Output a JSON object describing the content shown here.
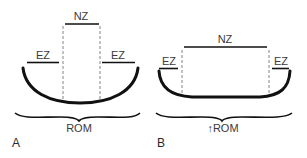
{
  "figure": {
    "panel_a": {
      "panel_label": "A",
      "neutral_zone_label": "NZ",
      "elastic_zone_left_label": "EZ",
      "elastic_zone_right_label": "EZ",
      "range_label": "ROM"
    },
    "panel_b": {
      "panel_label": "B",
      "neutral_zone_label": "NZ",
      "elastic_zone_left_label": "EZ",
      "elastic_zone_right_label": "EZ",
      "range_label": "↑ROM"
    },
    "colors": {
      "line": "#111111",
      "text": "#3a3a3a",
      "dashed": "#777777"
    }
  }
}
